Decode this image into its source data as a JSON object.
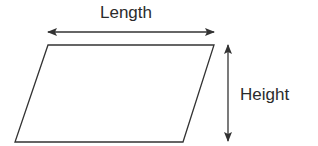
{
  "diagram": {
    "shape": "parallelogram",
    "labels": {
      "length": "Length",
      "height": "Height"
    },
    "colors": {
      "stroke": "#333333",
      "text": "#2b2b2b",
      "background": "#ffffff"
    }
  }
}
